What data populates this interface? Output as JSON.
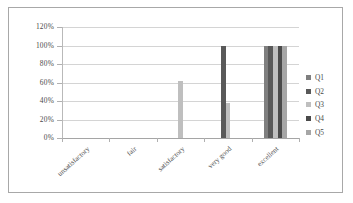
{
  "chart_data": {
    "type": "bar",
    "title": "",
    "xlabel": "",
    "ylabel": "",
    "categories": [
      "unsatisfactory",
      "fair",
      "satisfactory",
      "very good",
      "excellent"
    ],
    "series": [
      {
        "name": "Q1",
        "color": "#7f7f7f",
        "values": [
          0,
          0,
          0,
          0,
          100
        ]
      },
      {
        "name": "Q2",
        "color": "#595959",
        "values": [
          0,
          0,
          0,
          100,
          100
        ]
      },
      {
        "name": "Q3",
        "color": "#bfbfbf",
        "values": [
          0,
          0,
          62,
          38,
          100
        ]
      },
      {
        "name": "Q4",
        "color": "#4a4a4a",
        "values": [
          0,
          0,
          0,
          0,
          100
        ]
      },
      {
        "name": "Q5",
        "color": "#a6a6a6",
        "values": [
          0,
          0,
          0,
          0,
          100
        ]
      }
    ],
    "ylim": [
      0,
      120
    ],
    "yticks": [
      "0%",
      "20%",
      "40%",
      "60%",
      "80%",
      "100%",
      "120%"
    ],
    "ytick_values": [
      0,
      20,
      40,
      60,
      80,
      100,
      120
    ],
    "grid": true,
    "legend_position": "right",
    "legend_entries": [
      "Q1",
      "Q2",
      "Q3",
      "Q4",
      "Q5"
    ],
    "value_suffix": "%"
  }
}
